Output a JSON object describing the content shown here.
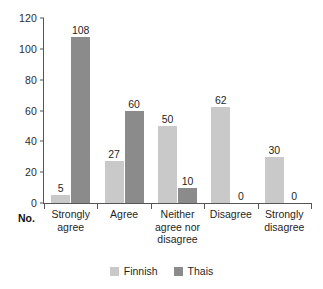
{
  "chart_data": {
    "type": "bar",
    "title": "",
    "subtitle": "",
    "xlabel": "No.",
    "ylabel": "",
    "categories": [
      "Strongly agree",
      "Agree",
      "Neither agree nor disagree",
      "Disagree",
      "Strongly disagree"
    ],
    "category_lines": [
      [
        "Strongly",
        "agree"
      ],
      [
        "Agree"
      ],
      [
        "Neither",
        "agree nor",
        "disagree"
      ],
      [
        "Disagree"
      ],
      [
        "Strongly",
        "disagree"
      ]
    ],
    "series": [
      {
        "name": "Finnish",
        "color": "#c9c9c9",
        "values": [
          5,
          27,
          50,
          62,
          30
        ]
      },
      {
        "name": "Thais",
        "color": "#8b8b8b",
        "values": [
          108,
          60,
          10,
          0,
          0
        ]
      }
    ],
    "value_labels": {
      "Finnish": [
        "5",
        "27",
        "50",
        "62",
        "30"
      ],
      "Thais": [
        "108",
        "60",
        "10",
        "0",
        "0"
      ]
    },
    "ylim": [
      0,
      120
    ],
    "yticks": [
      0,
      20,
      40,
      60,
      80,
      100,
      120
    ],
    "ytick_labels": [
      "0",
      "20",
      "40",
      "60",
      "80",
      "100",
      "120"
    ],
    "grid": false,
    "legend_position": "bottom",
    "legend": [
      "Finnish",
      "Thais"
    ]
  },
  "axis": {
    "x_axis_prefix": "No."
  }
}
